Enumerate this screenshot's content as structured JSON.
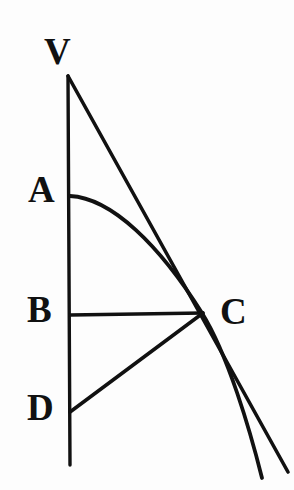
{
  "figure": {
    "kind": "geometric-line-diagram",
    "background_color": "#fdfdfd",
    "ink_color": "#111111",
    "width": 294,
    "height": 490,
    "labels": [
      {
        "id": "V",
        "text": "V",
        "x": 44,
        "y": 33,
        "point_x": 68,
        "point_y": 76
      },
      {
        "id": "A",
        "text": "A",
        "x": 28,
        "y": 171,
        "point_x": 70,
        "point_y": 196
      },
      {
        "id": "B",
        "text": "B",
        "x": 27,
        "y": 291,
        "point_x": 70,
        "point_y": 315
      },
      {
        "id": "D",
        "text": "D",
        "x": 27,
        "y": 389,
        "point_x": 70,
        "point_y": 412
      },
      {
        "id": "C",
        "text": "C",
        "x": 220,
        "y": 293,
        "point_x": 202,
        "point_y": 313
      }
    ],
    "strokes": [
      {
        "id": "vertical-axis",
        "name": "vertical-axis-line",
        "type": "line",
        "from": [
          68,
          76
        ],
        "to": [
          70,
          465
        ],
        "width": 3.4
      },
      {
        "id": "tangent-line",
        "name": "tangent-line-v-to-c",
        "type": "line",
        "from": [
          68,
          76
        ],
        "to": [
          288,
          472
        ],
        "width": 3.6
      },
      {
        "id": "curve",
        "name": "curve-a-through-c",
        "type": "curve",
        "path": "M 70 196 C 112 198 160 246 202 313 C 228 355 250 430 262 478",
        "width": 3.8
      },
      {
        "id": "chord-bc",
        "name": "horizontal-segment-b-to-c",
        "type": "line",
        "from": [
          70,
          315
        ],
        "to": [
          203,
          313
        ],
        "width": 3.4
      },
      {
        "id": "chord-dc",
        "name": "diagonal-segment-d-to-c",
        "type": "line",
        "from": [
          70,
          412
        ],
        "to": [
          203,
          313
        ],
        "width": 3.6
      }
    ]
  }
}
